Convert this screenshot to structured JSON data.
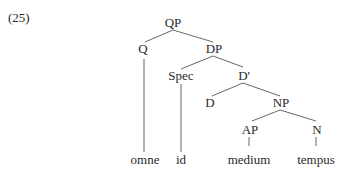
{
  "example_number": "(25)",
  "tree": {
    "nodes": {
      "QP": "QP",
      "Q": "Q",
      "DP": "DP",
      "Spec": "Spec",
      "Dbar": "D'",
      "D": "D",
      "NP": "NP",
      "AP": "AP",
      "N": "N"
    },
    "leaves": {
      "omne": "omne",
      "id": "id",
      "medium": "medium",
      "tempus": "tempus"
    },
    "structure": "[QP [Q omne] [DP [Spec id] [D' [D] [NP [AP medium] [N tempus]]]]]"
  }
}
